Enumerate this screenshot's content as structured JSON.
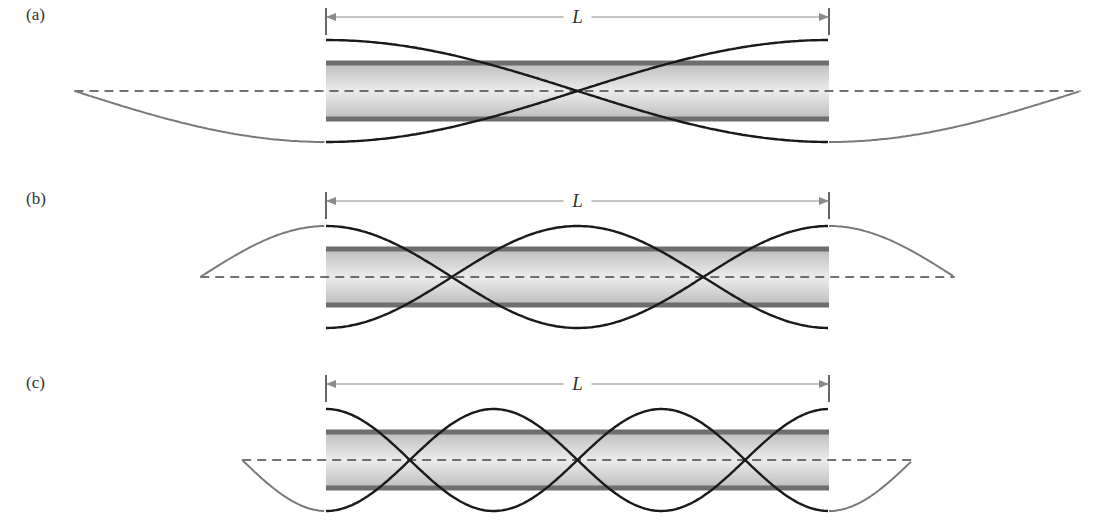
{
  "figure": {
    "panels": [
      {
        "id": "a",
        "label": "(a)",
        "length_label": "L",
        "nodes_in_tube": 1,
        "center_y": 91,
        "amplitude": 51,
        "tube_top": 63,
        "tube_bottom": 119,
        "dim_y": 17,
        "wavelength_px": 1006
      },
      {
        "id": "b",
        "label": "(b)",
        "length_label": "L",
        "nodes_in_tube": 2,
        "center_y": 277,
        "amplitude": 51,
        "tube_top": 249,
        "tube_bottom": 305,
        "dim_y": 201,
        "wavelength_px": 503
      },
      {
        "id": "c",
        "label": "(c)",
        "length_label": "L",
        "nodes_in_tube": 3,
        "center_y": 460,
        "amplitude": 51,
        "tube_top": 432,
        "tube_bottom": 488,
        "dim_y": 384,
        "wavelength_px": 335.3
      }
    ],
    "tube": {
      "x_start": 326,
      "x_end": 829
    },
    "colors": {
      "wave_inside": "#1a1a1a",
      "wave_outside": "#7a7a7a",
      "tube_wall": "#6e6e6e",
      "tube_fill_edge": "#bdbdbd",
      "tube_fill_center": "#ececec",
      "axis_dash": "#444444",
      "dimension_line": "#8a8a8a"
    }
  }
}
